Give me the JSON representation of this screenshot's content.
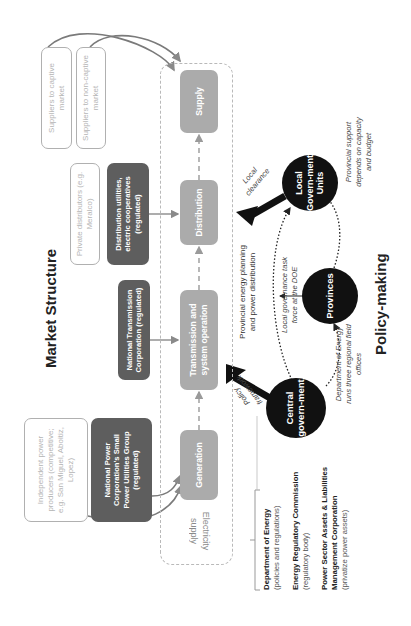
{
  "figure": {
    "orientation": "rotated 90° counter-clockwise",
    "market_structure": {
      "title": "Market Structure",
      "frame_label": "Electricity supply",
      "chain": [
        {
          "id": "generation",
          "label": "Generation"
        },
        {
          "id": "transmission",
          "label": "Transmission and system operation"
        },
        {
          "id": "distribution",
          "label": "Distribution"
        },
        {
          "id": "supply",
          "label": "Supply"
        }
      ],
      "actors": {
        "ipp": "Independent power producers (competitive; e.g. San Miguel, Aboitiz, Lopez)",
        "npc_spug": "National Power Corporation's Small Power Utilities Group (regulated)",
        "ntc": "National Transmission Corporation (regulated)",
        "private_distributors": "Private distributors (e.g. Meralco)",
        "distribution_utilities": "Distribution utilities, electric cooperatives (regulated)",
        "suppliers_captive": "Suppliers to captive market",
        "suppliers_noncaptive": "Suppliers to non-captive market"
      }
    },
    "policy_making": {
      "title": "Policy-making",
      "nodes": {
        "central": "Central govern-ment",
        "provinces": "Provinces",
        "lgu": "Local Govern-ment Units"
      },
      "arrow_labels": {
        "policy_framework": "Policy framework",
        "local_clearance": "Local clearance"
      },
      "annotations": {
        "provincial_planning": "Provincial energy planning and power distribution",
        "task_force": "Local governance task force at the DOE",
        "doe_field_offices": "Department of Energy runs three regional field offices",
        "provincial_support": "Provincial support depends on capacity and budget"
      },
      "central_agencies": [
        {
          "name": "Department of Energy",
          "role": "(policies and regulations)"
        },
        {
          "name": "Energy Regulatory Commission",
          "role": "(regulatory body)"
        },
        {
          "name": "Power Sector Assets & Liabilities Management Corporation",
          "role": "(privatize power assets)"
        }
      ]
    },
    "colors": {
      "dark_box": "#5e5e5e",
      "grey_box": "#ababab",
      "outline": "#b0b0b0",
      "circle": "#111111"
    }
  }
}
